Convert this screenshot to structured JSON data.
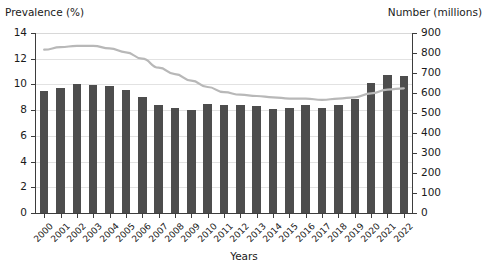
{
  "chart_data": {
    "type": "bar",
    "title": "",
    "subtitle": "",
    "xlabel": "Years",
    "ylabel": "Prevalence (%)",
    "y2label": "Number (millions)",
    "grid": true,
    "legend": "none",
    "ylim": [
      0,
      14
    ],
    "y2lim": [
      0,
      900
    ],
    "yticks": [
      0,
      2,
      4,
      6,
      8,
      10,
      12,
      14
    ],
    "y2ticks": [
      0,
      100,
      200,
      300,
      400,
      500,
      600,
      700,
      800,
      900
    ],
    "categories": [
      "2000",
      "2001",
      "2002",
      "2003",
      "2004",
      "2005",
      "2006",
      "2007",
      "2008",
      "2009",
      "2010",
      "2011",
      "2012",
      "2013",
      "2014",
      "2015",
      "2016",
      "2017",
      "2018",
      "2019",
      "2020",
      "2021",
      "2022"
    ],
    "series": [
      {
        "name": "Number (millions)",
        "type": "bar",
        "axis": "right",
        "color": "#4d4d4d",
        "values": [
          612,
          625,
          645,
          640,
          635,
          615,
          582,
          538,
          525,
          515,
          545,
          542,
          540,
          535,
          520,
          523,
          540,
          525,
          540,
          570,
          650,
          690,
          683
        ]
      },
      {
        "name": "Prevalence (%)",
        "type": "line",
        "axis": "left",
        "color": "#b8b8b8",
        "values": [
          12.7,
          12.9,
          13.0,
          13.0,
          12.8,
          12.5,
          12.0,
          11.3,
          10.8,
          10.3,
          9.8,
          9.4,
          9.2,
          9.1,
          9.0,
          8.9,
          8.9,
          8.8,
          8.9,
          9.0,
          9.3,
          9.6,
          9.7
        ]
      }
    ]
  },
  "axes": {
    "left_title": "Prevalence (%)",
    "right_title": "Number (millions)",
    "x_title": "Years"
  }
}
